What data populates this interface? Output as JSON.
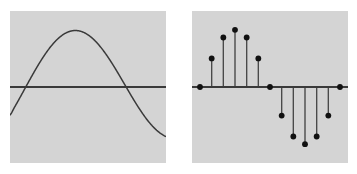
{
  "figure": {
    "title": "",
    "background_color": "#ffffff",
    "panel_color": "#d4d4d4",
    "ink_color": "#3a3a3a",
    "dot_color": "#111111",
    "panels": [
      {
        "name": "continuous-sine",
        "caption": "",
        "x": 10,
        "y": 11,
        "width": 156,
        "height": 152
      },
      {
        "name": "discrete-sine-stem",
        "caption": "",
        "x": 192,
        "y": 11,
        "width": 156,
        "height": 152
      }
    ]
  },
  "chart_data": [
    {
      "type": "line",
      "name": "continuous-sine",
      "title": "",
      "xlabel": "",
      "ylabel": "",
      "xlim": [
        0,
        1
      ],
      "ylim": [
        -1,
        1
      ],
      "grid": false,
      "legend": "none",
      "axis": {
        "zero_line": true,
        "zero_line_y": 0,
        "zero_crossings_x": [
          0.0833,
          0.5417,
          1.0
        ]
      },
      "annotations": [],
      "description": "One full period of a sine wave drawn as a smooth continuous curve on a gray panel with a horizontal zero axis.",
      "x": [
        0.0,
        0.0278,
        0.0556,
        0.0833,
        0.1111,
        0.1389,
        0.1667,
        0.1944,
        0.2222,
        0.25,
        0.2778,
        0.3056,
        0.3333,
        0.3611,
        0.3889,
        0.4167,
        0.4444,
        0.4722,
        0.5,
        0.5278,
        0.5556,
        0.5833,
        0.6111,
        0.6389,
        0.6667,
        0.6944,
        0.7222,
        0.75,
        0.7778,
        0.8056,
        0.8333,
        0.8611,
        0.8889,
        0.9167,
        0.9444,
        0.9722,
        1.0
      ],
      "y": [
        -0.4818,
        -0.3546,
        -0.2225,
        -0.0872,
        0.0491,
        0.1837,
        0.3143,
        0.4383,
        0.5536,
        0.6581,
        0.7501,
        0.8277,
        0.8898,
        0.9352,
        0.9634,
        0.9738,
        0.9664,
        0.9414,
        0.8993,
        0.841,
        0.7675,
        0.6802,
        0.5808,
        0.4712,
        0.3535,
        0.2298,
        0.1027,
        -0.0255,
        -0.1522,
        -0.2752,
        -0.3919,
        -0.5003,
        -0.5983,
        -0.6839,
        -0.7558,
        -0.8124,
        -0.8528
      ]
    },
    {
      "type": "stem",
      "name": "discrete-sine-stem",
      "title": "",
      "xlabel": "",
      "ylabel": "",
      "xlim": [
        0,
        12
      ],
      "ylim": [
        -1.05,
        1.05
      ],
      "grid": false,
      "legend": "none",
      "axis": {
        "zero_line": true,
        "zero_line_y": 0
      },
      "sample_count": 13,
      "description": "Discrete-time stem (lollipop) plot of the same sine wave sampled at 13 equally spaced points; vertical stems rise from a horizontal zero axis and each is capped with a filled black dot.",
      "categories": [
        0,
        1,
        2,
        3,
        4,
        5,
        6,
        7,
        8,
        9,
        10,
        11,
        12
      ],
      "values": [
        0.0,
        0.5,
        0.866,
        1.0,
        0.866,
        0.5,
        0.0,
        -0.5,
        -0.866,
        -1.0,
        -0.866,
        -0.5,
        0.0
      ]
    }
  ]
}
